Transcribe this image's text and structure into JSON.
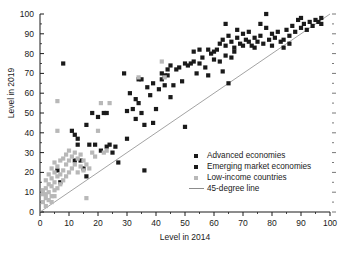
{
  "chart_data": {
    "type": "scatter",
    "title": "",
    "xlabel": "Level in 2014",
    "ylabel": "Level in 2019",
    "xlim": [
      0,
      100
    ],
    "ylim": [
      0,
      100
    ],
    "xticks": [
      0,
      10,
      20,
      30,
      40,
      50,
      60,
      70,
      80,
      90,
      100
    ],
    "yticks": [
      0,
      10,
      20,
      30,
      40,
      50,
      60,
      70,
      80,
      90,
      100
    ],
    "minor_tick_step": 5,
    "grid": false,
    "legend_position": "center-right",
    "colors": {
      "advanced": "#1a1a1a",
      "emerging": "#1a1a1a",
      "low_income": "#b8b8b8",
      "reference_line": "#8c8c8c",
      "axis": "#1a1a1a",
      "background": "#ffffff"
    },
    "reference_line": {
      "label": "45-degree line",
      "from": [
        0,
        0
      ],
      "to": [
        100,
        100
      ]
    },
    "series": [
      {
        "name": "Advanced economies",
        "marker": "square",
        "color": "#1a1a1a",
        "points": [
          [
            58,
            82
          ],
          [
            60,
            81
          ],
          [
            62,
            85
          ],
          [
            63,
            87
          ],
          [
            64,
            84
          ],
          [
            64,
            95
          ],
          [
            65,
            89
          ],
          [
            66,
            86
          ],
          [
            67,
            83
          ],
          [
            68,
            88
          ],
          [
            68,
            92
          ],
          [
            69,
            85
          ],
          [
            70,
            90
          ],
          [
            70,
            84
          ],
          [
            71,
            87
          ],
          [
            72,
            86
          ],
          [
            72,
            91
          ],
          [
            73,
            84
          ],
          [
            74,
            88
          ],
          [
            74,
            83
          ],
          [
            75,
            86
          ],
          [
            76,
            89
          ],
          [
            76,
            95
          ],
          [
            77,
            85
          ],
          [
            78,
            93
          ],
          [
            78,
            100
          ],
          [
            79,
            87
          ],
          [
            80,
            90
          ],
          [
            80,
            84
          ],
          [
            81,
            88
          ],
          [
            82,
            91
          ],
          [
            83,
            86
          ],
          [
            84,
            83
          ],
          [
            85,
            92
          ],
          [
            86,
            89
          ],
          [
            87,
            94
          ],
          [
            88,
            91
          ],
          [
            89,
            97
          ],
          [
            90,
            93
          ],
          [
            90,
            98
          ],
          [
            91,
            95
          ],
          [
            92,
            92
          ],
          [
            93,
            96
          ],
          [
            94,
            94
          ],
          [
            95,
            97
          ],
          [
            96,
            96
          ],
          [
            97,
            98
          ],
          [
            97,
            95
          ],
          [
            84,
            87
          ],
          [
            86,
            85
          ]
        ]
      },
      {
        "name": "Emerging market economies",
        "marker": "square",
        "color": "#1a1a1a",
        "points": [
          [
            8,
            75
          ],
          [
            6,
            21
          ],
          [
            7,
            15
          ],
          [
            11,
            41
          ],
          [
            12,
            39
          ],
          [
            12,
            26
          ],
          [
            13,
            37
          ],
          [
            13,
            34
          ],
          [
            14,
            26
          ],
          [
            15,
            22
          ],
          [
            16,
            18
          ],
          [
            16,
            44
          ],
          [
            17,
            34
          ],
          [
            18,
            50
          ],
          [
            19,
            34
          ],
          [
            20,
            48
          ],
          [
            21,
            31
          ],
          [
            22,
            50
          ],
          [
            23,
            33
          ],
          [
            23,
            50
          ],
          [
            24,
            34
          ],
          [
            25,
            30
          ],
          [
            26,
            33
          ],
          [
            27,
            25
          ],
          [
            29,
            70
          ],
          [
            30,
            51
          ],
          [
            30,
            37
          ],
          [
            31,
            60
          ],
          [
            32,
            52
          ],
          [
            33,
            47
          ],
          [
            33,
            57
          ],
          [
            34,
            55
          ],
          [
            34,
            67
          ],
          [
            35,
            50
          ],
          [
            35,
            67
          ],
          [
            36,
            21
          ],
          [
            36,
            44
          ],
          [
            37,
            63
          ],
          [
            38,
            59
          ],
          [
            39,
            65
          ],
          [
            40,
            52
          ],
          [
            41,
            62
          ],
          [
            42,
            70
          ],
          [
            43,
            64
          ],
          [
            43,
            69
          ],
          [
            44,
            72
          ],
          [
            45,
            74
          ],
          [
            45,
            58
          ],
          [
            46,
            64
          ],
          [
            47,
            72
          ],
          [
            48,
            73
          ],
          [
            49,
            66
          ],
          [
            50,
            43
          ],
          [
            50,
            75
          ],
          [
            51,
            74
          ],
          [
            52,
            75
          ],
          [
            53,
            76
          ],
          [
            54,
            70
          ],
          [
            55,
            75
          ],
          [
            56,
            78
          ],
          [
            57,
            73
          ],
          [
            58,
            69
          ],
          [
            59,
            80
          ],
          [
            60,
            77
          ],
          [
            61,
            82
          ],
          [
            62,
            76
          ],
          [
            63,
            71
          ],
          [
            64,
            79
          ],
          [
            65,
            65
          ],
          [
            66,
            78
          ],
          [
            67,
            81
          ],
          [
            55,
            82
          ],
          [
            53,
            81
          ],
          [
            44,
            69
          ],
          [
            42,
            67
          ],
          [
            39,
            45
          ]
        ]
      },
      {
        "name": "Low-income countries",
        "marker": "square",
        "color": "#b8b8b8",
        "points": [
          [
            1,
            5
          ],
          [
            1,
            9
          ],
          [
            2,
            7
          ],
          [
            2,
            12
          ],
          [
            2,
            16
          ],
          [
            3,
            10
          ],
          [
            3,
            14
          ],
          [
            3,
            19
          ],
          [
            4,
            8
          ],
          [
            4,
            13
          ],
          [
            4,
            17
          ],
          [
            4,
            22
          ],
          [
            5,
            11
          ],
          [
            5,
            15
          ],
          [
            5,
            20
          ],
          [
            5,
            25
          ],
          [
            6,
            12
          ],
          [
            6,
            18
          ],
          [
            6,
            23
          ],
          [
            6,
            41
          ],
          [
            6,
            56
          ],
          [
            7,
            14
          ],
          [
            7,
            19
          ],
          [
            7,
            26
          ],
          [
            8,
            16
          ],
          [
            8,
            21
          ],
          [
            8,
            27
          ],
          [
            9,
            18
          ],
          [
            9,
            24
          ],
          [
            9,
            29
          ],
          [
            10,
            20
          ],
          [
            10,
            26
          ],
          [
            10,
            31
          ],
          [
            11,
            22
          ],
          [
            11,
            28
          ],
          [
            12,
            24
          ],
          [
            12,
            30
          ],
          [
            13,
            20
          ],
          [
            13,
            27
          ],
          [
            14,
            23
          ],
          [
            14,
            29
          ],
          [
            15,
            21
          ],
          [
            15,
            26
          ],
          [
            16,
            7
          ],
          [
            16,
            24
          ],
          [
            17,
            22
          ],
          [
            18,
            30
          ],
          [
            19,
            28
          ],
          [
            20,
            41
          ],
          [
            21,
            55
          ],
          [
            22,
            30
          ],
          [
            23,
            31
          ],
          [
            24,
            55
          ],
          [
            34,
            68
          ],
          [
            42,
            76
          ],
          [
            43,
            68
          ],
          [
            2,
            3
          ],
          [
            3,
            6
          ],
          [
            4,
            5
          ],
          [
            5,
            8
          ],
          [
            1,
            11
          ],
          [
            2,
            9
          ]
        ]
      }
    ]
  },
  "axis": {
    "x_tick_labels": [
      "0",
      "10",
      "20",
      "30",
      "40",
      "50",
      "60",
      "70",
      "80",
      "90",
      "100"
    ],
    "y_tick_labels": [
      "0",
      "10",
      "20",
      "30",
      "40",
      "50",
      "60",
      "70",
      "80",
      "90",
      "100"
    ],
    "x_title": "Level in 2014",
    "y_title": "Level in 2019"
  },
  "legend": {
    "items": [
      {
        "label": "Advanced economies",
        "type": "marker",
        "color": "#1a1a1a"
      },
      {
        "label": "Emerging market economies",
        "type": "marker",
        "color": "#1a1a1a"
      },
      {
        "label": "Low-income countries",
        "type": "marker",
        "color": "#b8b8b8"
      },
      {
        "label": "45-degree line",
        "type": "line",
        "color": "#8c8c8c"
      }
    ]
  }
}
